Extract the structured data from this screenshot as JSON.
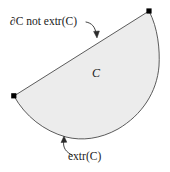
{
  "figure": {
    "background_color": "#ffffff",
    "width": 170,
    "height": 172,
    "region": {
      "name": "C",
      "fill_color": "#ececec",
      "stroke_color": "#4a4a4a",
      "stroke_width": 0.9,
      "shape": "circular-segment"
    },
    "vertices": [
      {
        "name": "left-vertex",
        "x": 14,
        "y": 96,
        "marker": "filled-square",
        "color": "#000000"
      },
      {
        "name": "top-right-vertex",
        "x": 149,
        "y": 11,
        "marker": "filled-square",
        "color": "#000000"
      }
    ],
    "labels": {
      "interior": "C",
      "top_annotation": "∂C not extr(C)",
      "bottom_annotation": "extr(C)"
    },
    "annotations": [
      {
        "name": "chord-annotation",
        "text": "∂C not extr(C)",
        "target": "straight-chord-edge",
        "arrow_tip": {
          "x": 97,
          "y": 37
        }
      },
      {
        "name": "arc-annotation",
        "text": "extr(C)",
        "target": "curved-arc-edge",
        "arrow_tip": {
          "x": 64,
          "y": 136
        }
      }
    ]
  }
}
